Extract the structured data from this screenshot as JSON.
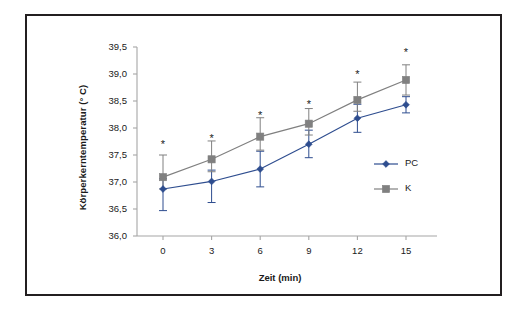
{
  "chart_data": {
    "type": "line",
    "title": "",
    "xlabel": "Zeit (min)",
    "ylabel": "Körperkerntemperatur (° C)",
    "x": [
      0,
      3,
      6,
      9,
      12,
      15
    ],
    "categories": [
      "0",
      "3",
      "6",
      "9",
      "12",
      "15"
    ],
    "xlim": [
      -1.5,
      16.5
    ],
    "ylim": [
      36.0,
      39.5
    ],
    "yticks": [
      36.0,
      36.5,
      37.0,
      37.5,
      38.0,
      38.5,
      39.0,
      39.5
    ],
    "ytick_labels": [
      "36,0",
      "36,5",
      "37,0",
      "37,5",
      "38,0",
      "38,5",
      "39,0",
      "39,5"
    ],
    "xtick_labels": [
      "0",
      "3",
      "6",
      "9",
      "12",
      "15"
    ],
    "grid": false,
    "legend_position": "right-middle",
    "series": [
      {
        "name": "PC",
        "color": "#2e4d8f",
        "marker": "diamond",
        "values": [
          36.87,
          37.01,
          37.24,
          37.7,
          38.18,
          38.43
        ],
        "error_upper": [
          0.19,
          0.21,
          0.33,
          0.26,
          0.26,
          0.15
        ],
        "error_lower": [
          0.4,
          0.39,
          0.33,
          0.25,
          0.26,
          0.15
        ]
      },
      {
        "name": "K",
        "color": "#808080",
        "marker": "square",
        "values": [
          37.09,
          37.42,
          37.84,
          38.08,
          38.52,
          38.89
        ],
        "error_upper": [
          0.41,
          0.34,
          0.35,
          0.28,
          0.33,
          0.28
        ],
        "error_lower": [
          0.22,
          0.23,
          0.25,
          0.21,
          0.21,
          0.28
        ]
      }
    ],
    "annotations": [
      {
        "label": "*",
        "x": 0,
        "y": 37.68
      },
      {
        "label": "*",
        "x": 3,
        "y": 37.79
      },
      {
        "label": "*",
        "x": 6,
        "y": 38.22
      },
      {
        "label": "*",
        "x": 9,
        "y": 38.42
      },
      {
        "label": "*",
        "x": 12,
        "y": 38.99
      },
      {
        "label": "*",
        "x": 15,
        "y": 39.38
      }
    ],
    "legend": [
      {
        "label": "PC",
        "color": "#2e4d8f",
        "marker": "diamond"
      },
      {
        "label": "K",
        "color": "#808080",
        "marker": "square"
      }
    ],
    "axis_color": "#a6a6a6",
    "frame_color": "#231f20",
    "background": "#ffffff"
  }
}
